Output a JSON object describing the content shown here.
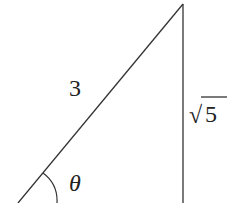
{
  "diagram": {
    "type": "right-triangle",
    "hypotenuse_label": "3",
    "opposite_label": "5",
    "opposite_radical": "√",
    "angle_label": "θ",
    "line_color": "#333333"
  }
}
